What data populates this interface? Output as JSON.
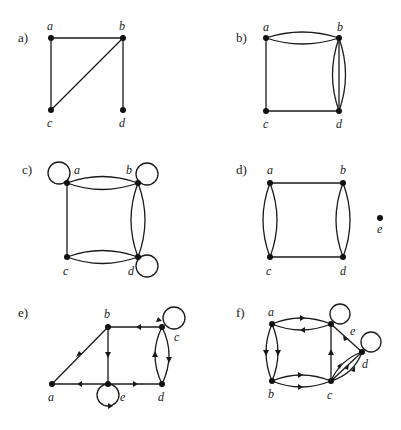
{
  "panels": [
    {
      "label": "a)",
      "directed": false,
      "vertices": [
        "a",
        "b",
        "c",
        "d"
      ],
      "edges": [
        [
          "a",
          "b"
        ],
        [
          "a",
          "c"
        ],
        [
          "b",
          "c"
        ],
        [
          "b",
          "d"
        ]
      ],
      "loops": []
    },
    {
      "label": "b)",
      "directed": false,
      "vertices": [
        "a",
        "b",
        "c",
        "d"
      ],
      "edges": [
        [
          "a",
          "b"
        ],
        [
          "a",
          "b"
        ],
        [
          "a",
          "c"
        ],
        [
          "b",
          "d"
        ],
        [
          "b",
          "d"
        ],
        [
          "b",
          "d"
        ],
        [
          "c",
          "d"
        ]
      ],
      "loops": []
    },
    {
      "label": "c)",
      "directed": false,
      "vertices": [
        "a",
        "b",
        "c",
        "d"
      ],
      "edges": [
        [
          "a",
          "b"
        ],
        [
          "a",
          "b"
        ],
        [
          "a",
          "c"
        ],
        [
          "b",
          "d"
        ],
        [
          "b",
          "d"
        ],
        [
          "c",
          "d"
        ],
        [
          "c",
          "d"
        ]
      ],
      "loops": [
        "a",
        "b",
        "d"
      ]
    },
    {
      "label": "d)",
      "directed": false,
      "vertices": [
        "a",
        "b",
        "c",
        "d",
        "e"
      ],
      "edges": [
        [
          "a",
          "b"
        ],
        [
          "a",
          "c"
        ],
        [
          "a",
          "c"
        ],
        [
          "b",
          "d"
        ],
        [
          "b",
          "d"
        ],
        [
          "c",
          "d"
        ]
      ],
      "loops": []
    },
    {
      "label": "e)",
      "directed": true,
      "vertices": [
        "a",
        "b",
        "c",
        "d",
        "e"
      ],
      "edges": [
        [
          "a",
          "b"
        ],
        [
          "c",
          "b"
        ],
        [
          "b",
          "e"
        ],
        [
          "e",
          "a"
        ],
        [
          "e",
          "d"
        ],
        [
          "c",
          "d"
        ],
        [
          "d",
          "c"
        ]
      ],
      "loops": [
        "c",
        "e"
      ]
    },
    {
      "label": "f)",
      "directed": true,
      "vertices": [
        "a",
        "b",
        "c",
        "d",
        "e"
      ],
      "edges": [
        [
          "a",
          "e"
        ],
        [
          "e",
          "a"
        ],
        [
          "a",
          "b"
        ],
        [
          "a",
          "b"
        ],
        [
          "b",
          "c"
        ],
        [
          "b",
          "c"
        ],
        [
          "c",
          "e"
        ],
        [
          "e",
          "d"
        ],
        [
          "c",
          "d"
        ],
        [
          "c",
          "d"
        ],
        [
          "c",
          "d"
        ]
      ],
      "loops": [
        "e",
        "d"
      ]
    }
  ]
}
